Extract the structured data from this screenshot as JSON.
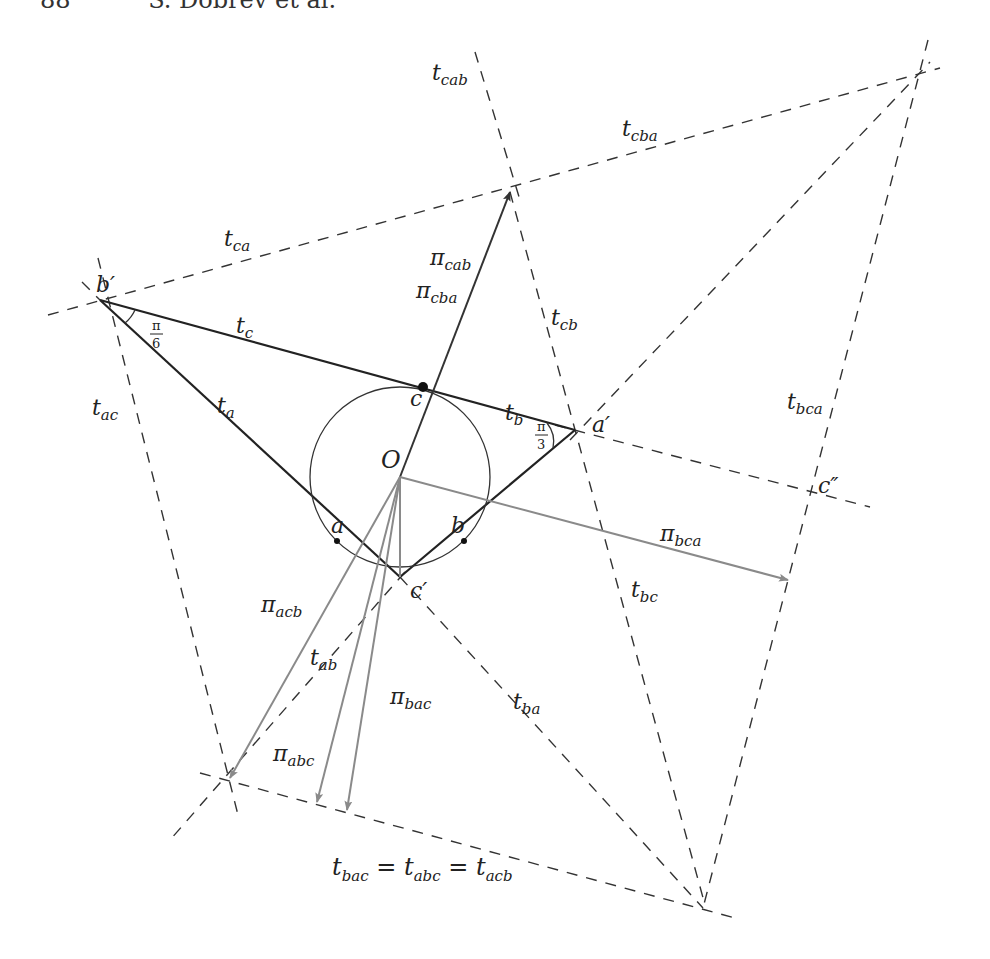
{
  "header": {
    "page_number": "88",
    "authors": "S. Dobrev et al."
  },
  "figure": {
    "points": {
      "b_prime": "b′",
      "a_prime": "a′",
      "c_prime": "c′",
      "c_double_prime": "c″",
      "center": "O",
      "tangent_a": "a",
      "tangent_b": "b",
      "tangent_c": "c"
    },
    "angles": {
      "at_b_prime": {
        "num": "π",
        "den": "6"
      },
      "at_a_prime": {
        "num": "π",
        "den": "3"
      }
    },
    "line_labels": {
      "t_c": {
        "base": "t",
        "sub": "c"
      },
      "t_a": {
        "base": "t",
        "sub": "a"
      },
      "t_b": {
        "base": "t",
        "sub": "b"
      },
      "t_ca": {
        "base": "t",
        "sub": "ca"
      },
      "t_cab": {
        "base": "t",
        "sub": "cab"
      },
      "t_cba": {
        "base": "t",
        "sub": "cba"
      },
      "t_cb": {
        "base": "t",
        "sub": "cb"
      },
      "t_ac": {
        "base": "t",
        "sub": "ac"
      },
      "t_bca": {
        "base": "t",
        "sub": "bca"
      },
      "t_bc": {
        "base": "t",
        "sub": "bc"
      },
      "t_ba": {
        "base": "t",
        "sub": "ba"
      },
      "t_ab": {
        "base": "t",
        "sub": "ab"
      }
    },
    "projection_labels": {
      "pi_cab": {
        "base": "π",
        "sub": "cab"
      },
      "pi_cba": {
        "base": "π",
        "sub": "cba"
      },
      "pi_bca": {
        "base": "π",
        "sub": "bca"
      },
      "pi_acb": {
        "base": "π",
        "sub": "acb"
      },
      "pi_abc": {
        "base": "π",
        "sub": "abc"
      },
      "pi_bac": {
        "base": "π",
        "sub": "bac"
      }
    },
    "equation": {
      "parts": [
        {
          "base": "t",
          "sub": "bac"
        },
        {
          "op": "="
        },
        {
          "base": "t",
          "sub": "abc"
        },
        {
          "op": "="
        },
        {
          "base": "t",
          "sub": "acb"
        }
      ]
    }
  }
}
